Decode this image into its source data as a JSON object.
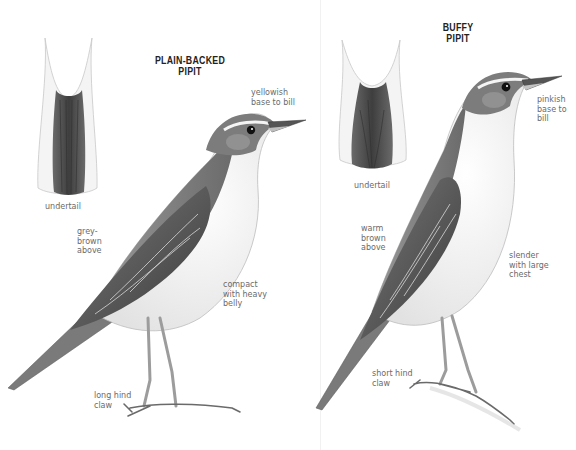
{
  "plates": [
    {
      "species": "PLAIN-BACKED\nPIPIT",
      "title_line1": "PLAIN-BACKED",
      "title_line2": "PIPIT",
      "labels": {
        "bill": "yellowish\nbase to bill",
        "undertail": "undertail",
        "upperparts": "grey-\nbrown\nabove",
        "body": "compact\nwith heavy\nbelly",
        "claw": "long hind\nclaw"
      }
    },
    {
      "species": "BUFFY\nPIPIT",
      "title_line1": "BUFFY",
      "title_line2": "PIPIT",
      "labels": {
        "bill": "pinkish\nbase to\nbill",
        "undertail": "undertail",
        "upperparts": "warm\nbrown\nabove",
        "body": "slender\nwith large\nchest",
        "claw": "short hind\nclaw"
      }
    }
  ],
  "colors": {
    "background": "#ffffff",
    "title": "#222222",
    "label": "#6a6a6a",
    "plumage_dark": "#4a4a4a",
    "plumage_mid": "#8a8a8a",
    "plumage_light": "#e8e8e8"
  }
}
